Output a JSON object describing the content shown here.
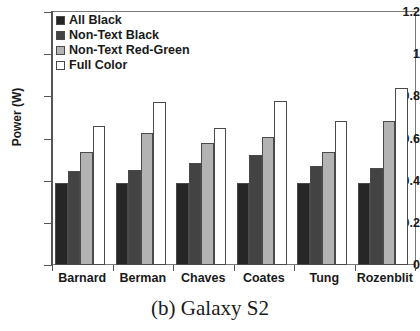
{
  "caption": "(b) Galaxy S2",
  "colors": {
    "all_black": "#262626",
    "non_text_black": "#434343",
    "non_text_red_green": "#b3b3b3",
    "full_color": "#ffffff",
    "bar_outline": "#4a4a4a",
    "axis": "#555555",
    "text": "#1a1a1a"
  },
  "chart_data": {
    "type": "bar",
    "title": "(b) Galaxy S2",
    "xlabel": "",
    "ylabel": "Power (W)",
    "ylim": [
      0,
      1.2
    ],
    "ytick_values": [
      0,
      0.2,
      0.4,
      0.6,
      0.8,
      1,
      1.2
    ],
    "ytick_labels": [
      "0",
      "0.2",
      "0.4",
      "0.6",
      "0.8",
      "1",
      "1.2"
    ],
    "grid": false,
    "legend_position": "top-left",
    "categories": [
      "Barnard",
      "Berman",
      "Chaves",
      "Coates",
      "Tung",
      "Rozenblit"
    ],
    "series": [
      {
        "name": "All Black",
        "color": "#262626",
        "values": [
          0.39,
          0.39,
          0.39,
          0.39,
          0.39,
          0.39
        ]
      },
      {
        "name": "Non-Text Black",
        "color": "#434343",
        "values": [
          0.445,
          0.45,
          0.485,
          0.52,
          0.47,
          0.46
        ]
      },
      {
        "name": "Non-Text Red-Green",
        "color": "#b3b3b3",
        "values": [
          0.535,
          0.625,
          0.58,
          0.605,
          0.535,
          0.685
        ]
      },
      {
        "name": "Full Color",
        "color": "#ffffff",
        "values": [
          0.66,
          0.775,
          0.65,
          0.78,
          0.685,
          0.84
        ]
      }
    ]
  }
}
